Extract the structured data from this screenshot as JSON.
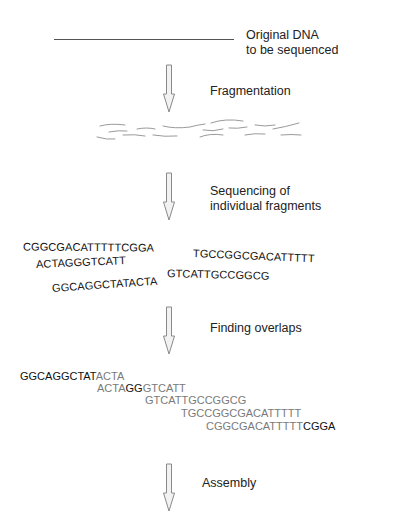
{
  "original": {
    "label_line1": "Original DNA",
    "label_line2": "to be sequenced"
  },
  "steps": [
    {
      "label": "Fragmentation"
    },
    {
      "label_line1": "Sequencing of",
      "label_line2": "individual fragments"
    },
    {
      "label": "Finding overlaps"
    },
    {
      "label": "Assembly"
    }
  ],
  "reads": [
    "CGGCGACATTTTTCGGA",
    "ACTAGGGTCATT",
    "GGCAGGCTATACTA",
    "TGCCGGCGACATTTTT",
    "GTCATTGCCGGCG"
  ],
  "overlaps": [
    {
      "parts": [
        {
          "text": "GGCAGGCTAT",
          "style": "k"
        },
        {
          "text": "ACTA",
          "style": "g"
        }
      ]
    },
    {
      "parts": [
        {
          "text": "ACTA",
          "style": "g"
        },
        {
          "text": "GG",
          "style": "k"
        },
        {
          "text": "GTCATT",
          "style": "g"
        }
      ]
    },
    {
      "parts": [
        {
          "text": "GTCATTGCCGGCG",
          "style": "g"
        }
      ]
    },
    {
      "parts": [
        {
          "text": "TGCCGGCGACATTTTT",
          "style": "g"
        }
      ]
    },
    {
      "parts": [
        {
          "text": "CGGCGACATTTTT",
          "style": "g"
        },
        {
          "text": "CGGA",
          "style": "k"
        }
      ]
    }
  ],
  "colors": {
    "arrow_fill": "#f2f2f2",
    "arrow_stroke": "#8a8a8a",
    "fragment_stroke": "#9a9a9a",
    "overlap_gray": "#7a7a7a",
    "overlap_black": "#111111"
  }
}
